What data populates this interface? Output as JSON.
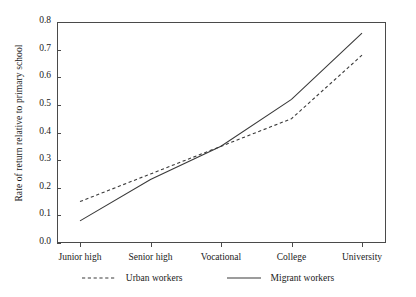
{
  "chart_data": {
    "type": "line",
    "title": "",
    "xlabel": "",
    "ylabel": "Rate of return relative to primary school",
    "categories": [
      "Junior high",
      "Senior high",
      "Vocational",
      "College",
      "University"
    ],
    "ylim": [
      0.0,
      0.8
    ],
    "yticks": [
      "0.0",
      "0.1",
      "0.2",
      "0.3",
      "0.4",
      "0.5",
      "0.6",
      "0.7",
      "0.8"
    ],
    "ytick_values": [
      0.0,
      0.1,
      0.2,
      0.3,
      0.4,
      0.5,
      0.6,
      0.7,
      0.8
    ],
    "grid": false,
    "legend_position": "bottom",
    "series": [
      {
        "name": "Urban workers",
        "style": "dashed",
        "color": "#3a3a3a",
        "values": [
          0.15,
          0.25,
          0.35,
          0.45,
          0.68
        ]
      },
      {
        "name": "Migrant workers",
        "style": "solid",
        "color": "#3a3a3a",
        "values": [
          0.08,
          0.23,
          0.35,
          0.52,
          0.76
        ]
      }
    ]
  }
}
